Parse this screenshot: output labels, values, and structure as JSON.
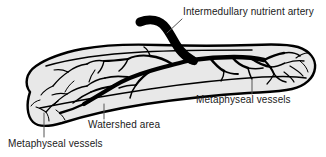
{
  "figure": {
    "background_color": "#ffffff",
    "bone_fill_color": "#e8e8e8",
    "bone_outline_color": "#000000",
    "vessel_color": "#000000",
    "label_color": "#1a1a1a",
    "leader_line_color": "#555555"
  },
  "labels": {
    "nutrient_artery": "Intermedullary nutrient artery",
    "metaphyseal_right": "Metaphyseal vessels",
    "watershed": "Watershed area",
    "metaphyseal_left": "Metaphyseal vessels"
  },
  "leaders": {
    "nutrient_artery": "diagonal-up-right",
    "metaphyseal_right": "vertical",
    "watershed": "vertical",
    "metaphyseal_left": "vertical"
  },
  "structures": {
    "bone": "long-bone-outline",
    "nutrient_artery": "intramedullary-nutrient-artery",
    "proximal_branches": "ascending-medullary-branches",
    "distal_branches": "descending-medullary-branches",
    "metaphyseal_network_left": "left-metaphyseal-vessel-network",
    "metaphyseal_network_right": "right-metaphyseal-vessel-network"
  }
}
